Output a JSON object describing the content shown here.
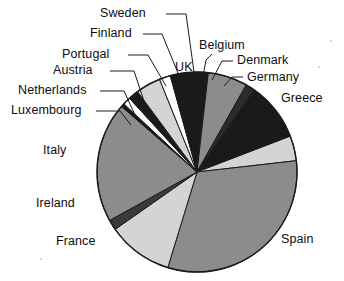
{
  "chart_data": {
    "type": "pie",
    "title": "",
    "subtitle": "",
    "xlabel": "",
    "ylabel": "",
    "legend_position": "none",
    "grid": false,
    "labels_outside": true,
    "start_angle_deg": 0,
    "direction": "clockwise",
    "categories": [
      "UK",
      "Belgium",
      "Denmark",
      "Germany",
      "Greece",
      "Spain",
      "France",
      "Ireland",
      "Italy",
      "Luxembourg",
      "Netherlands",
      "Austria",
      "Portugal",
      "Finland",
      "Sweden"
    ],
    "values": [
      1.8,
      6.4,
      1.5,
      9.5,
      4.1,
      31.5,
      10.5,
      1.6,
      19.5,
      0.5,
      1.3,
      1.7,
      4.0,
      1.8,
      4.3
    ],
    "slices": [
      {
        "name": "UK",
        "value": 1.8,
        "start_deg": 0.0,
        "end_deg": 6.5,
        "fill": "#1a1a1a",
        "label_leader": false
      },
      {
        "name": "Belgium",
        "value": 6.4,
        "start_deg": 6.5,
        "end_deg": 29.5,
        "fill": "#8c8c8c",
        "label_leader": true
      },
      {
        "name": "Denmark",
        "value": 1.5,
        "start_deg": 29.5,
        "end_deg": 35.0,
        "fill": "#2b2b2b",
        "label_leader": true
      },
      {
        "name": "Germany",
        "value": 9.5,
        "start_deg": 35.0,
        "end_deg": 69.0,
        "fill": "#1a1a1a",
        "label_leader": true
      },
      {
        "name": "Greece",
        "value": 4.1,
        "start_deg": 69.0,
        "end_deg": 83.5,
        "fill": "#d4d4d4",
        "label_leader": false
      },
      {
        "name": "Spain",
        "value": 31.5,
        "start_deg": 83.5,
        "end_deg": 197.0,
        "fill": "#8c8c8c",
        "label_leader": false
      },
      {
        "name": "France",
        "value": 10.5,
        "start_deg": 197.0,
        "end_deg": 235.0,
        "fill": "#d4d4d4",
        "label_leader": false
      },
      {
        "name": "Ireland",
        "value": 1.6,
        "start_deg": 235.0,
        "end_deg": 241.0,
        "fill": "#3a3a3a",
        "label_leader": false
      },
      {
        "name": "Italy",
        "value": 19.5,
        "start_deg": 241.0,
        "end_deg": 311.0,
        "fill": "#8c8c8c",
        "label_leader": false
      },
      {
        "name": "Luxembourg",
        "value": 0.5,
        "start_deg": 311.0,
        "end_deg": 313.0,
        "fill": "#1a1a1a",
        "label_leader": true
      },
      {
        "name": "Netherlands",
        "value": 1.3,
        "start_deg": 313.0,
        "end_deg": 317.5,
        "fill": "#ffffff",
        "label_leader": true
      },
      {
        "name": "Austria",
        "value": 1.7,
        "start_deg": 317.5,
        "end_deg": 323.5,
        "fill": "#1a1a1a",
        "label_leader": true
      },
      {
        "name": "Portugal",
        "value": 4.0,
        "start_deg": 323.5,
        "end_deg": 338.0,
        "fill": "#d4d4d4",
        "label_leader": true
      },
      {
        "name": "Finland",
        "value": 1.8,
        "start_deg": 338.0,
        "end_deg": 344.5,
        "fill": "#ffffff",
        "label_leader": true
      },
      {
        "name": "Sweden",
        "value": 4.3,
        "start_deg": 344.5,
        "end_deg": 360.0,
        "fill": "#1a1a1a",
        "label_leader": true
      }
    ]
  },
  "labels": {
    "sweden": "Sweden",
    "finland": "Finland",
    "portugal": "Portugal",
    "austria": "Austria",
    "netherlands": "Netherlands",
    "luxembourg": "Luxembourg",
    "italy": "Italy",
    "ireland": "Ireland",
    "france": "France",
    "uk": "UK",
    "belgium": "Belgium",
    "denmark": "Denmark",
    "germany": "Germany",
    "greece": "Greece",
    "spain": "Spain"
  },
  "colors": {
    "outline": "#1a1a1a",
    "dark": "#1a1a1a",
    "mid_gray": "#8c8c8c",
    "light_gray": "#d4d4d4",
    "white": "#ffffff",
    "background": "#ffffff",
    "text": "#0d0d0d"
  }
}
